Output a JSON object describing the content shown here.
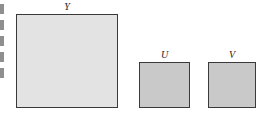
{
  "diagram": {
    "planes": [
      {
        "id": "y",
        "label": "Y",
        "color": "#e3e3e3"
      },
      {
        "id": "u",
        "label": "U",
        "color": "#c9c9c9"
      },
      {
        "id": "v",
        "label": "V",
        "color": "#c9c9c9"
      }
    ],
    "border_color": "#3a3a3a"
  }
}
